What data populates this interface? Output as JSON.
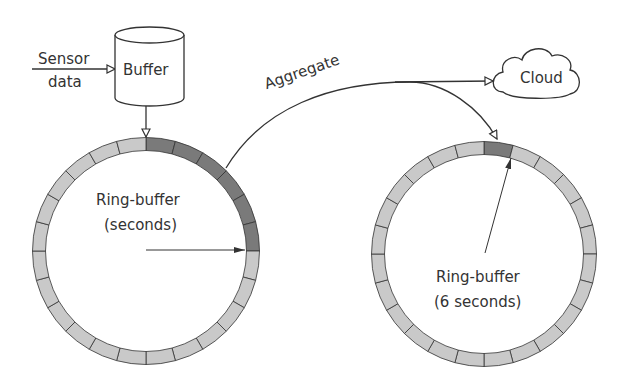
{
  "labels": {
    "sensor_line1": "Sensor",
    "sensor_line2": "data",
    "buffer": "Buffer",
    "aggregate": "Aggregate",
    "cloud": "Cloud",
    "ring_left_line1": "Ring-buffer",
    "ring_left_line2": "(seconds)",
    "ring_right_line1": "Ring-buffer",
    "ring_right_line2": "(6 seconds)"
  },
  "rings": {
    "segments": 24,
    "left": {
      "cx": 146,
      "cy": 251,
      "r": 107,
      "filled_segments": [
        0,
        1,
        2,
        3,
        4,
        5
      ]
    },
    "right": {
      "cx": 484,
      "cy": 254,
      "r": 106,
      "filled_segments": [
        0
      ]
    }
  },
  "colors": {
    "segment_light": "#c9c9c9",
    "segment_dark": "#7a7a7a",
    "stroke": "#333333"
  }
}
